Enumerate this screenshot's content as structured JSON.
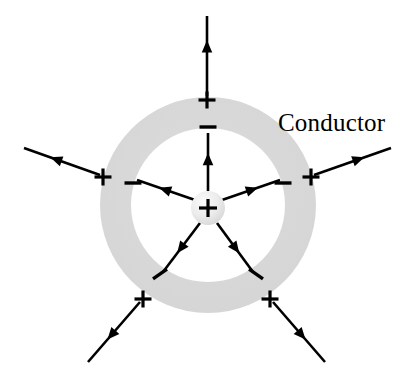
{
  "figure": {
    "title_label": "Conductor",
    "label_position": {
      "x": 278,
      "y": 131
    },
    "background_color": "#ffffff",
    "line_color": "#000000",
    "conductor_fill_color": "#d9d9d9",
    "core_fill_color": "#e8e8e8"
  },
  "conductor_shell": {
    "name": "hollow spherical conductor shell (annulus)",
    "center": {
      "cx": 208,
      "cy": 205
    },
    "outer_radius": 108,
    "inner_radius": 77,
    "fill": "#d9d9d9"
  },
  "central_charge": {
    "name": "point charge inside cavity",
    "sign": "+",
    "center": {
      "cx": 208,
      "cy": 208
    },
    "radius": 17,
    "fill": "#e8e8e8"
  },
  "induced_inner_charges": [
    {
      "sign": "−",
      "x": 208,
      "y": 127,
      "rotation": 0,
      "angle_deg": 90
    },
    {
      "sign": "−",
      "x": 133,
      "y": 183,
      "rotation": 0,
      "angle_deg": 150
    },
    {
      "sign": "−",
      "x": 283,
      "y": 183,
      "rotation": 0,
      "angle_deg": 30
    },
    {
      "sign": "−",
      "x": 160,
      "y": 274,
      "rotation": -35,
      "angle_deg": 234
    },
    {
      "sign": "−",
      "x": 256,
      "y": 274,
      "rotation": 35,
      "angle_deg": 306
    }
  ],
  "induced_outer_charges": [
    {
      "sign": "+",
      "x": 207,
      "y": 100,
      "angle_deg": 90
    },
    {
      "sign": "+",
      "x": 103,
      "y": 177,
      "angle_deg": 162
    },
    {
      "sign": "+",
      "x": 311,
      "y": 177,
      "angle_deg": 18
    },
    {
      "sign": "+",
      "x": 143,
      "y": 299,
      "angle_deg": 234
    },
    {
      "sign": "+",
      "x": 270,
      "y": 299,
      "angle_deg": 306
    }
  ],
  "inner_field_lines": [
    {
      "name": "inner-field-line-up",
      "from": {
        "x": 208,
        "y": 191
      },
      "to": {
        "x": 208,
        "y": 133
      },
      "arrow_at": 0.55
    },
    {
      "name": "inner-field-line-upper-left",
      "from": {
        "x": 195,
        "y": 200
      },
      "to": {
        "x": 137,
        "y": 180
      },
      "arrow_at": 0.52
    },
    {
      "name": "inner-field-line-upper-right",
      "from": {
        "x": 222,
        "y": 200
      },
      "to": {
        "x": 280,
        "y": 180
      },
      "arrow_at": 0.52
    },
    {
      "name": "inner-field-line-lower-left",
      "from": {
        "x": 200,
        "y": 223
      },
      "to": {
        "x": 163,
        "y": 272
      },
      "arrow_at": 0.52
    },
    {
      "name": "inner-field-line-lower-right",
      "from": {
        "x": 217,
        "y": 223
      },
      "to": {
        "x": 253,
        "y": 272
      },
      "arrow_at": 0.52
    }
  ],
  "outer_field_lines": [
    {
      "name": "outer-field-line-up",
      "from": {
        "x": 207,
        "y": 96
      },
      "to": {
        "x": 207,
        "y": 16
      },
      "arrow_at": 0.62
    },
    {
      "name": "outer-field-line-upper-left",
      "from": {
        "x": 100,
        "y": 175
      },
      "to": {
        "x": 24,
        "y": 148
      },
      "arrow_at": 0.58
    },
    {
      "name": "outer-field-line-upper-right",
      "from": {
        "x": 314,
        "y": 175
      },
      "to": {
        "x": 391,
        "y": 148
      },
      "arrow_at": 0.58
    },
    {
      "name": "outer-field-line-lower-left",
      "from": {
        "x": 140,
        "y": 302
      },
      "to": {
        "x": 88,
        "y": 362
      },
      "arrow_at": 0.55
    },
    {
      "name": "outer-field-line-lower-right",
      "from": {
        "x": 273,
        "y": 302
      },
      "to": {
        "x": 325,
        "y": 362
      },
      "arrow_at": 0.55
    }
  ]
}
